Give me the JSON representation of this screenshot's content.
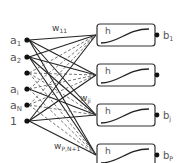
{
  "diagram": {
    "type": "single-layer neural network",
    "inputs": [
      {
        "label": "a",
        "sub": "1",
        "y": 40,
        "visible_label": true
      },
      {
        "label": "a",
        "sub": "2",
        "y": 57,
        "visible_label": true
      },
      {
        "label": "",
        "sub": "",
        "y": 73,
        "visible_label": false
      },
      {
        "label": "a",
        "sub": "i",
        "y": 89,
        "visible_label": true
      },
      {
        "label": "a",
        "sub": "N",
        "y": 105,
        "visible_label": true
      },
      {
        "label": "1",
        "sub": "",
        "y": 121,
        "visible_label": true
      }
    ],
    "neurons": [
      {
        "function": "h",
        "output_label": "b",
        "output_sub": "1",
        "y": 24
      },
      {
        "function": "h",
        "output_label": "b",
        "output_sub": "",
        "y": 64
      },
      {
        "function": "h",
        "output_label": "b",
        "output_sub": "j",
        "y": 104
      },
      {
        "function": "h",
        "output_label": "b",
        "output_sub": "P",
        "y": 144
      }
    ],
    "weight_labels": [
      {
        "text": "w",
        "sub": "11",
        "x": 52,
        "y": 31
      },
      {
        "text": "w",
        "sub": "ji",
        "x": 80,
        "y": 101
      },
      {
        "text": "w",
        "sub": "P,N+1",
        "x": 54,
        "y": 149
      }
    ],
    "colors": {
      "line": "#222222",
      "dashed": "#666666",
      "box": "#333333",
      "text": "#555555"
    }
  }
}
